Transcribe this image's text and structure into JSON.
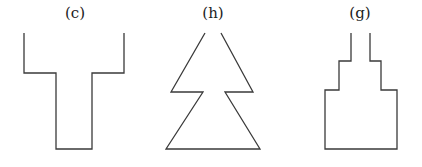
{
  "figures": [
    {
      "id": "c",
      "label": "(c)",
      "label_x": 75,
      "description": "T-shaped open outline",
      "points": "24,33 24,73 56,73 56,149 92,149 92,73 124,73 124,33"
    },
    {
      "id": "h",
      "label": "(h)",
      "label_x": 213,
      "description": "Two stacked triangles (tree) open at apex",
      "points": "205,33 171,92 203,92 166,149 260,149 225,92 253,92 221,33"
    },
    {
      "id": "g",
      "label": "(g)",
      "label_x": 360,
      "description": "Stepped tower outline open at top",
      "points": "351,33 351,61 339,61 339,90 325,90 325,149 397,149 397,90 381,90 381,61 370,61 370,33"
    }
  ],
  "colors": {
    "stroke": "#3a3a3a",
    "text": "#222222",
    "background": "#ffffff"
  }
}
